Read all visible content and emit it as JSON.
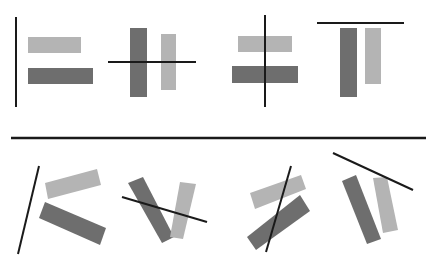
{
  "colors": {
    "background": "#ffffff",
    "line": "#1a1a1a",
    "dark_bar": "#6e6e6e",
    "light_bar": "#b4b4b4"
  },
  "divider": {
    "x1": 11,
    "y1": 138,
    "x2": 426,
    "y2": 138
  },
  "panels": [
    {
      "id": "top-1",
      "description": "vertical line left of two horizontal bars",
      "line": {
        "x1": 16,
        "y1": 17,
        "x2": 16,
        "y2": 107
      },
      "bars": [
        {
          "shade": "light",
          "points": "28,37 81,37 81,53 28,53"
        },
        {
          "shade": "dark",
          "points": "28,68 93,68 93,84 28,84"
        }
      ]
    },
    {
      "id": "top-2",
      "description": "horizontal line crossing two vertical bars",
      "line": {
        "x1": 108,
        "y1": 62,
        "x2": 196,
        "y2": 62
      },
      "bars": [
        {
          "shade": "dark",
          "points": "130,28 147,28 147,97 130,97"
        },
        {
          "shade": "light",
          "points": "161,34 176,34 176,90 161,90"
        }
      ]
    },
    {
      "id": "top-3",
      "description": "vertical line crossing two horizontal bars",
      "line": {
        "x1": 265,
        "y1": 15,
        "x2": 265,
        "y2": 107
      },
      "bars": [
        {
          "shade": "light",
          "points": "238,36 292,36 292,52 238,52"
        },
        {
          "shade": "dark",
          "points": "232,66 298,66 298,83 232,83"
        }
      ]
    },
    {
      "id": "top-4",
      "description": "horizontal line above two vertical bars",
      "line": {
        "x1": 317,
        "y1": 23,
        "x2": 404,
        "y2": 23
      },
      "bars": [
        {
          "shade": "dark",
          "points": "340,28 357,28 357,97 340,97"
        },
        {
          "shade": "light",
          "points": "365,28 381,28 381,84 365,84"
        }
      ]
    },
    {
      "id": "bottom-1",
      "description": "tilted line left of two rotated bars",
      "line": {
        "x1": 39,
        "y1": 166,
        "x2": 18,
        "y2": 254
      },
      "bars": [
        {
          "shade": "light",
          "points": "45,183 97,169 101,185 48,199"
        },
        {
          "shade": "dark",
          "points": "45,202 106,228 100,245 39,218"
        }
      ]
    },
    {
      "id": "bottom-2",
      "description": "tilted line crossing two rotated bars",
      "line": {
        "x1": 122,
        "y1": 197,
        "x2": 207,
        "y2": 222
      },
      "bars": [
        {
          "shade": "dark",
          "points": "128,183 143,177 174,237 162,243"
        },
        {
          "shade": "light",
          "points": "180,182 196,184 183,239 170,237"
        }
      ]
    },
    {
      "id": "bottom-3",
      "description": "tilted line crossing two rotated bars",
      "line": {
        "x1": 291,
        "y1": 166,
        "x2": 266,
        "y2": 252
      },
      "bars": [
        {
          "shade": "light",
          "points": "250,193 301,175 306,189 255,209"
        },
        {
          "shade": "dark",
          "points": "247,237 300,195 310,211 256,250"
        }
      ]
    },
    {
      "id": "bottom-4",
      "description": "tilted line above two rotated bars",
      "line": {
        "x1": 333,
        "y1": 153,
        "x2": 413,
        "y2": 190
      },
      "bars": [
        {
          "shade": "dark",
          "points": "342,181 356,175 381,239 367,244"
        },
        {
          "shade": "light",
          "points": "373,178 387,177 398,230 383,233"
        }
      ]
    }
  ]
}
